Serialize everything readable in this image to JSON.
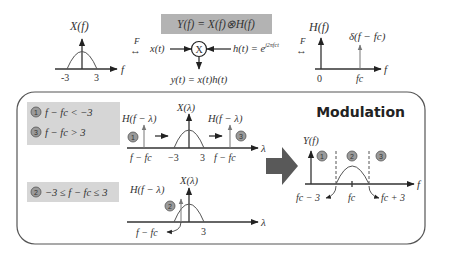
{
  "top": {
    "equation_box": {
      "text": "Y(f) = X(f)⊗H(f)",
      "bg": "#b3b3b3"
    },
    "x_spectrum": {
      "label": "X(f)",
      "ticks": [
        "-3",
        "3"
      ],
      "axis": "f"
    },
    "fourier_left": {
      "label": "F",
      "symbol": "↔"
    },
    "fourier_right": {
      "label": "F",
      "symbol": "↔"
    },
    "mixer": {
      "input_x": "x(t)",
      "input_h": "h(t) = e",
      "h_exponent": "j2πfct",
      "symbol": "X",
      "output": "y(t) = x(t)h(t)"
    },
    "h_spectrum": {
      "label": "H(f)",
      "impulse_label": "δ(f − fc)",
      "ticks": [
        "0",
        "fc"
      ],
      "axis": "f"
    }
  },
  "panel": {
    "title": "Modulation",
    "case_box_1": {
      "cases": [
        {
          "badge": "1",
          "text": "f − fc < −3"
        },
        {
          "badge": "3",
          "text": "f − fc > 3"
        }
      ],
      "bg": "#d6d6d6"
    },
    "case_box_2": {
      "cases": [
        {
          "badge": "2",
          "text": "−3 ≤ f − fc ≤ 3"
        }
      ],
      "bg": "#d6d6d6"
    },
    "conv_plot_1": {
      "h_left": "H(f − λ)",
      "x_label": "X(λ)",
      "h_right": "H(f − λ)",
      "badge_left": "1",
      "badge_right": "3",
      "ticks": [
        "f − fc",
        "−3",
        "3",
        "f − fc"
      ],
      "axis": "λ"
    },
    "conv_plot_2": {
      "h_label": "H(f − λ)",
      "x_label": "X(λ)",
      "badge": "2",
      "ticks": [
        "f − fc",
        "3"
      ],
      "axis": "λ"
    },
    "result_plot": {
      "label": "Y(f)",
      "badges": [
        "1",
        "2",
        "3"
      ],
      "ticks": [
        "fc − 3",
        "fc",
        "fc + 3"
      ],
      "axis": "f"
    },
    "arrow_color": "#595959"
  }
}
